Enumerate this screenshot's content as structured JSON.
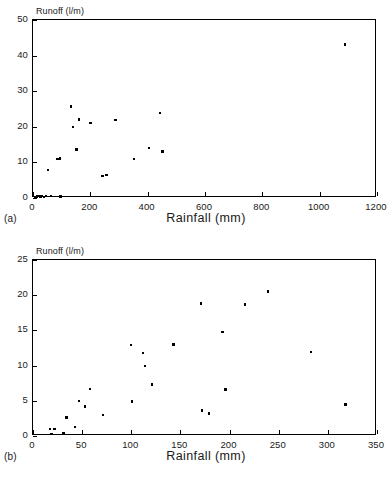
{
  "figure": {
    "panels": [
      {
        "letter": "(a)",
        "ylabel": "Runoff (l/m)",
        "xlabel": "Rainfall (mm)",
        "title": "Santa Fe 1 (r = .7689  si = .0000)"
      },
      {
        "letter": "(b)",
        "ylabel": "Runoff (l/m)",
        "xlabel": "Rainfall (mm)",
        "title": "La Castanya 2 (r = .5986  si = .0016)"
      }
    ]
  },
  "chart_data": [
    {
      "type": "scatter",
      "title": "Santa Fe 1 (r = .7689  si = .0000)",
      "panel_label": "(a)",
      "xlabel": "Rainfall (mm)",
      "ylabel": "Runoff (l/m)",
      "xlim": [
        0,
        1200
      ],
      "ylim": [
        0,
        50
      ],
      "xticks": [
        0,
        200,
        400,
        600,
        800,
        1000,
        1200
      ],
      "yticks": [
        0,
        10,
        20,
        30,
        40,
        50
      ],
      "grid": false,
      "legend": "none",
      "marker": "filled-square",
      "stats": {
        "r": ".7689",
        "si": ".0000"
      },
      "points": [
        {
          "x": 8,
          "y": 0.3
        },
        {
          "x": 14,
          "y": 0.4
        },
        {
          "x": 20,
          "y": 0.5
        },
        {
          "x": 26,
          "y": 0.4
        },
        {
          "x": 32,
          "y": 0.6
        },
        {
          "x": 38,
          "y": 0.3
        },
        {
          "x": 46,
          "y": 0.5
        },
        {
          "x": 62,
          "y": 0.6
        },
        {
          "x": 96,
          "y": 0.4
        },
        {
          "x": 52,
          "y": 7.9
        },
        {
          "x": 86,
          "y": 11.0
        },
        {
          "x": 94,
          "y": 11.1
        },
        {
          "x": 133,
          "y": 25.7
        },
        {
          "x": 140,
          "y": 19.9
        },
        {
          "x": 152,
          "y": 13.6
        },
        {
          "x": 160,
          "y": 22.0
        },
        {
          "x": 201,
          "y": 21.0
        },
        {
          "x": 243,
          "y": 6.2
        },
        {
          "x": 256,
          "y": 6.4
        },
        {
          "x": 288,
          "y": 21.9
        },
        {
          "x": 352,
          "y": 10.9
        },
        {
          "x": 404,
          "y": 14.0
        },
        {
          "x": 443,
          "y": 23.8
        },
        {
          "x": 452,
          "y": 13.1
        },
        {
          "x": 1088,
          "y": 43.1
        }
      ]
    },
    {
      "type": "scatter",
      "title": "La Castanya 2 (r = .5986  si = .0016)",
      "panel_label": "(b)",
      "xlabel": "Rainfall (mm)",
      "ylabel": "Runoff (l/m)",
      "xlim": [
        0,
        350
      ],
      "ylim": [
        0,
        25
      ],
      "xticks": [
        0,
        50,
        100,
        150,
        200,
        250,
        300,
        350
      ],
      "yticks": [
        0,
        5,
        10,
        15,
        20,
        25
      ],
      "grid": false,
      "legend": "none",
      "marker": "filled-square",
      "stats": {
        "r": ".5986",
        "si": ".0016"
      },
      "points": [
        {
          "x": 17,
          "y": 1.0
        },
        {
          "x": 19,
          "y": 0.3
        },
        {
          "x": 22,
          "y": 1.0
        },
        {
          "x": 31,
          "y": 0.4
        },
        {
          "x": 34,
          "y": 2.6
        },
        {
          "x": 43,
          "y": 1.3
        },
        {
          "x": 47,
          "y": 5.0
        },
        {
          "x": 53,
          "y": 4.2
        },
        {
          "x": 58,
          "y": 6.7
        },
        {
          "x": 71,
          "y": 3.0
        },
        {
          "x": 100,
          "y": 12.9
        },
        {
          "x": 101,
          "y": 4.9
        },
        {
          "x": 112,
          "y": 11.8
        },
        {
          "x": 114,
          "y": 9.9
        },
        {
          "x": 121,
          "y": 7.3
        },
        {
          "x": 143,
          "y": 13.0
        },
        {
          "x": 171,
          "y": 18.8
        },
        {
          "x": 172,
          "y": 3.6
        },
        {
          "x": 179,
          "y": 3.2
        },
        {
          "x": 193,
          "y": 14.8
        },
        {
          "x": 196,
          "y": 6.6
        },
        {
          "x": 216,
          "y": 18.7
        },
        {
          "x": 239,
          "y": 20.5
        },
        {
          "x": 283,
          "y": 11.9
        },
        {
          "x": 318,
          "y": 4.5
        }
      ]
    }
  ]
}
